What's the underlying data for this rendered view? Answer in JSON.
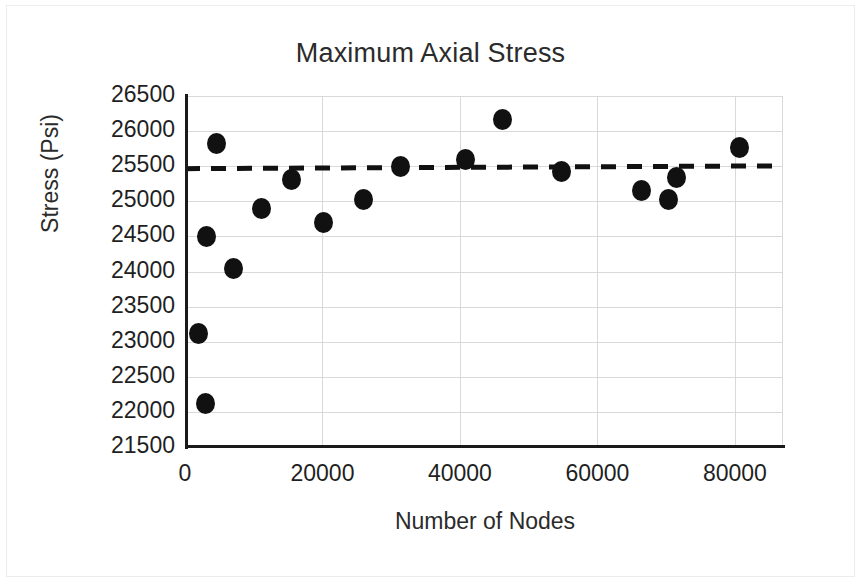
{
  "chart_data": {
    "type": "scatter",
    "title": "Maximum Axial Stress",
    "xlabel": "Number of Nodes",
    "ylabel": "Stress (Psi)",
    "xlim": [
      0,
      87000
    ],
    "ylim": [
      21500,
      26500
    ],
    "xticks": [
      0,
      20000,
      40000,
      60000,
      80000
    ],
    "xtick_labels": [
      "0",
      "20000",
      "40000",
      "60000",
      "80000"
    ],
    "yticks": [
      21500,
      22000,
      22500,
      23000,
      23500,
      24000,
      24500,
      25000,
      25500,
      26000,
      26500
    ],
    "ytick_labels": [
      "21500",
      "22000",
      "22500",
      "23000",
      "23500",
      "24000",
      "24500",
      "25000",
      "25500",
      "26000",
      "26500"
    ],
    "grid": "both",
    "legend": "none",
    "marker_color": "#111111",
    "marker_shape": "circle",
    "series": [
      {
        "name": "Maximum Axial Stress",
        "points": [
          {
            "x": 2000,
            "y": 23120
          },
          {
            "x": 3000,
            "y": 22120
          },
          {
            "x": 3200,
            "y": 24500
          },
          {
            "x": 4600,
            "y": 25830
          },
          {
            "x": 7000,
            "y": 24040
          },
          {
            "x": 11200,
            "y": 24900
          },
          {
            "x": 15500,
            "y": 25310
          },
          {
            "x": 20200,
            "y": 24700
          },
          {
            "x": 26000,
            "y": 25030
          },
          {
            "x": 31300,
            "y": 25490
          },
          {
            "x": 40800,
            "y": 25600
          },
          {
            "x": 46200,
            "y": 26160
          },
          {
            "x": 54800,
            "y": 25430
          },
          {
            "x": 66400,
            "y": 25150
          },
          {
            "x": 70300,
            "y": 25020
          },
          {
            "x": 71500,
            "y": 25340
          },
          {
            "x": 80600,
            "y": 25760
          }
        ]
      }
    ],
    "trendline": {
      "style": "dashed",
      "color": "#111111",
      "x_start": 0,
      "y_start": 25465,
      "x_end": 87000,
      "y_end": 25505
    }
  }
}
